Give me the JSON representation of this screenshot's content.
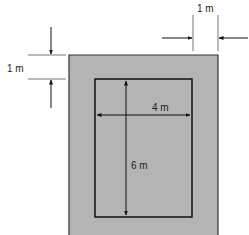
{
  "diagram": {
    "type": "dimensioned-floor-plan",
    "colors": {
      "background": "#ffffff",
      "outer_fill": "#b4b4b4",
      "outer_stroke": "#333333",
      "inner_stroke": "#111111",
      "dim_line": "#777777",
      "arrow": "#111111"
    },
    "outer_border": {
      "label": "1 m"
    },
    "inner_room": {
      "width_label": "4 m",
      "height_label": "6 m"
    },
    "dimensions": [
      {
        "id": "top-margin",
        "label": "1 m",
        "orientation": "vertical"
      },
      {
        "id": "right-margin",
        "label": "1 m",
        "orientation": "horizontal"
      },
      {
        "id": "inner-width",
        "label": "4 m",
        "orientation": "horizontal"
      },
      {
        "id": "inner-height",
        "label": "6 m",
        "orientation": "vertical"
      }
    ]
  }
}
